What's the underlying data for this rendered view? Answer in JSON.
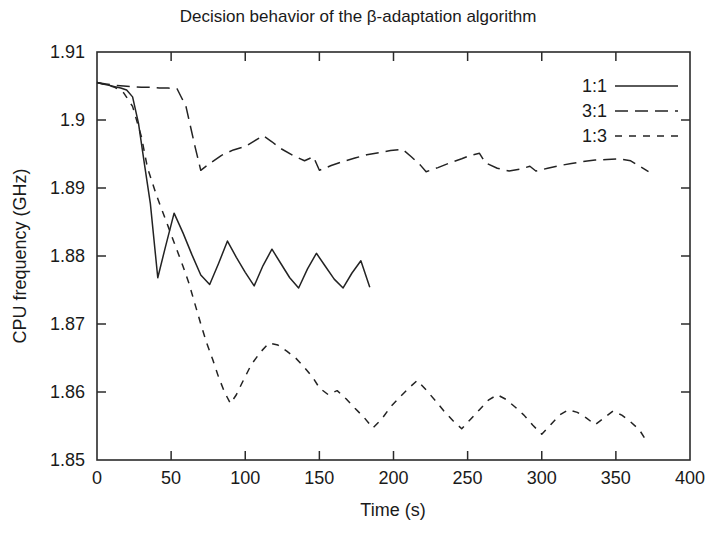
{
  "chart_data": {
    "type": "line",
    "title": "Decision behavior of the β-adaptation algorithm",
    "xlabel": "Time (s)",
    "ylabel": "CPU frequency (GHz)",
    "xlim": [
      0,
      400
    ],
    "ylim": [
      1.85,
      1.91
    ],
    "xticks": [
      0,
      50,
      100,
      150,
      200,
      250,
      300,
      350,
      400
    ],
    "xtick_labels": [
      "0",
      "50",
      "100",
      "150",
      "200",
      "250",
      "300",
      "350",
      "400"
    ],
    "yticks": [
      1.85,
      1.86,
      1.87,
      1.88,
      1.89,
      1.9,
      1.91
    ],
    "ytick_labels": [
      "1.85",
      "1.86",
      "1.87",
      "1.88",
      "1.89",
      "1.9",
      "1.91"
    ],
    "grid": false,
    "legend_position": "top-right",
    "legend_entries": [
      "1:1",
      "3:1",
      "1:3"
    ],
    "series": [
      {
        "name": "1:1",
        "style": "solid",
        "x": [
          0,
          4,
          8,
          12,
          16,
          20,
          24,
          28,
          32,
          36,
          41,
          46,
          52,
          58,
          64,
          70,
          76,
          82,
          88,
          94,
          100,
          106,
          112,
          118,
          124,
          130,
          136,
          142,
          148,
          154,
          160,
          166,
          172,
          178,
          184
        ],
        "y": [
          1.9055,
          1.9053,
          1.9051,
          1.9049,
          1.9047,
          1.9044,
          1.9034,
          1.8995,
          1.8935,
          1.8877,
          1.8768,
          1.8812,
          1.8863,
          1.8834,
          1.8802,
          1.8772,
          1.8758,
          1.8789,
          1.8822,
          1.8798,
          1.8776,
          1.8756,
          1.8786,
          1.881,
          1.8789,
          1.8768,
          1.8753,
          1.8781,
          1.8804,
          1.8785,
          1.8766,
          1.8753,
          1.8775,
          1.8793,
          1.8754
        ]
      },
      {
        "name": "3:1",
        "style": "long-dash",
        "x": [
          0,
          6,
          12,
          18,
          24,
          30,
          36,
          42,
          48,
          54,
          60,
          66,
          70,
          76,
          84,
          92,
          100,
          106,
          112,
          118,
          124,
          132,
          140,
          146,
          150,
          158,
          166,
          174,
          182,
          190,
          198,
          206,
          212,
          218,
          222,
          230,
          238,
          246,
          252,
          258,
          262,
          270,
          278,
          286,
          292,
          296,
          304,
          312,
          320,
          328,
          336,
          344,
          352,
          360,
          366,
          372
        ],
        "y": [
          1.9055,
          1.9053,
          1.9051,
          1.905,
          1.9049,
          1.9048,
          1.9048,
          1.9047,
          1.9047,
          1.9046,
          1.902,
          1.8962,
          1.8926,
          1.8936,
          1.8948,
          1.8956,
          1.8961,
          1.8969,
          1.8977,
          1.8968,
          1.8958,
          1.8948,
          1.894,
          1.8946,
          1.8926,
          1.8933,
          1.8939,
          1.8944,
          1.8949,
          1.8952,
          1.8955,
          1.8957,
          1.8946,
          1.8934,
          1.8924,
          1.893,
          1.8937,
          1.8943,
          1.8948,
          1.8951,
          1.8937,
          1.8929,
          1.8925,
          1.8928,
          1.8932,
          1.8925,
          1.8929,
          1.8933,
          1.8936,
          1.8939,
          1.8941,
          1.8942,
          1.8943,
          1.894,
          1.8932,
          1.8924
        ]
      },
      {
        "name": "1:3",
        "style": "short-dash",
        "x": [
          0,
          6,
          12,
          18,
          24,
          30,
          34,
          40,
          46,
          52,
          58,
          62,
          66,
          70,
          74,
          78,
          82,
          86,
          90,
          94,
          98,
          104,
          110,
          116,
          122,
          128,
          134,
          140,
          146,
          150,
          156,
          162,
          168,
          174,
          180,
          186,
          192,
          198,
          204,
          210,
          216,
          222,
          228,
          234,
          240,
          246,
          252,
          258,
          264,
          270,
          276,
          282,
          288,
          294,
          300,
          306,
          312,
          318,
          324,
          330,
          336,
          342,
          348,
          354,
          360,
          366,
          370
        ],
        "y": [
          1.9055,
          1.9052,
          1.9048,
          1.904,
          1.902,
          1.8975,
          1.893,
          1.889,
          1.8855,
          1.882,
          1.8785,
          1.876,
          1.873,
          1.87,
          1.8672,
          1.8648,
          1.8622,
          1.86,
          1.8583,
          1.8596,
          1.8614,
          1.864,
          1.8658,
          1.8672,
          1.8669,
          1.866,
          1.865,
          1.8636,
          1.862,
          1.8606,
          1.8596,
          1.8602,
          1.859,
          1.8576,
          1.8563,
          1.8547,
          1.856,
          1.8578,
          1.8592,
          1.8605,
          1.8617,
          1.8603,
          1.8588,
          1.8572,
          1.8558,
          1.8546,
          1.856,
          1.8574,
          1.8588,
          1.8596,
          1.8589,
          1.8578,
          1.8566,
          1.8551,
          1.8538,
          1.8552,
          1.8566,
          1.8574,
          1.857,
          1.8562,
          1.8552,
          1.8562,
          1.8572,
          1.8566,
          1.8556,
          1.8544,
          1.853
        ]
      }
    ]
  },
  "legend": {
    "items": [
      {
        "label": "1:1",
        "style": "solid"
      },
      {
        "label": "3:1",
        "style": "long-dash"
      },
      {
        "label": "1:3",
        "style": "short-dash"
      }
    ]
  },
  "colors": {
    "ink": "#232323",
    "frame": "#2b2b2b",
    "background": "#ffffff"
  }
}
